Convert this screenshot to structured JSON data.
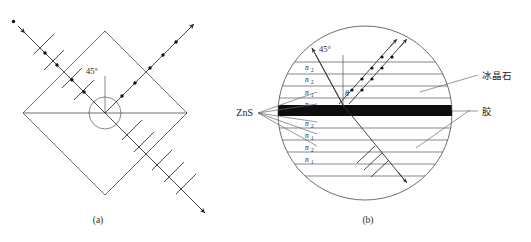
{
  "figure": {
    "title_caption_a": "(a)",
    "title_caption_b": "(b)",
    "panel_a": {
      "angle_label": "45°",
      "shape": "square-prism-rotated-45",
      "rays": {
        "incident_label": "",
        "reflected_label": "",
        "transmitted_label": ""
      }
    },
    "panel_b": {
      "angle_label": "45°",
      "refraction_angle_label": "θ",
      "material_left_label": "ZnS",
      "material_right_top_label": "冰晶石",
      "material_right_bottom_label": "胶",
      "layers": [
        {
          "index": 0,
          "n_symbol": "n",
          "n_subscript": "2"
        },
        {
          "index": 1,
          "n_symbol": "n",
          "n_subscript": "2"
        },
        {
          "index": 2,
          "n_symbol": "n",
          "n_subscript": "1"
        },
        {
          "index": 3,
          "n_symbol": "n",
          "n_subscript": "2"
        },
        {
          "index": 4,
          "n_symbol": "n",
          "n_subscript": "2"
        },
        {
          "index": 5,
          "n_symbol": "n",
          "n_subscript": "1"
        },
        {
          "index": 6,
          "n_symbol": "n",
          "n_subscript": "2"
        },
        {
          "index": 7,
          "n_symbol": "n",
          "n_subscript": "1"
        }
      ]
    },
    "colors": {
      "line": "#4a4a4a",
      "ray": "#333333",
      "band": "#0d0d0d",
      "text": "#1a1a1a",
      "background": "#ffffff"
    }
  }
}
